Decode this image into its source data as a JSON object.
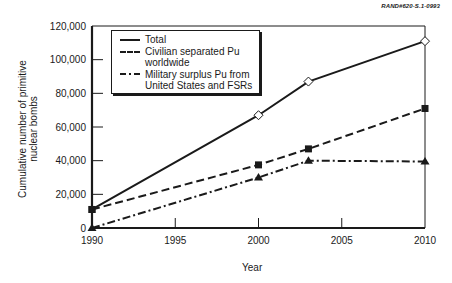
{
  "chart_data": {
    "type": "line",
    "title": "",
    "reference_id": "RAND#620-S.1-0993",
    "xlabel": "Year",
    "ylabel": "Cumulative number of primitive nuclear bombs",
    "xlim": [
      1990,
      2010
    ],
    "ylim": [
      0,
      120000
    ],
    "x_ticks": [
      "1990",
      "1995",
      "2000",
      "2005",
      "2010"
    ],
    "y_ticks": [
      "0",
      "20,000",
      "40,000",
      "60,000",
      "80,000",
      "100,000",
      "120,000"
    ],
    "grid": false,
    "legend_position": "upper left",
    "x": [
      1990,
      2000,
      2003,
      2010
    ],
    "series": [
      {
        "name": "Total",
        "style": "solid",
        "marker": "open-diamond",
        "values": [
          11000,
          67000,
          87000,
          111000
        ]
      },
      {
        "name": "Civilian separated Pu worldwide",
        "style": "dashed",
        "marker": "filled-square",
        "values": [
          11000,
          37500,
          47000,
          71000
        ]
      },
      {
        "name": "Military surplus Pu from United States and FSRs",
        "style": "dash-dot",
        "marker": "filled-triangle",
        "values": [
          0,
          30000,
          40000,
          39500
        ]
      }
    ]
  },
  "legend": {
    "items": [
      {
        "line1": "Total",
        "line2": ""
      },
      {
        "line1": "Civilian separated Pu",
        "line2": "worldwide"
      },
      {
        "line1": "Military surplus Pu from",
        "line2": "United States and FSRs"
      }
    ]
  },
  "axes": {
    "xlabel": "Year",
    "ylabel_line1": "Cumulative number of primitive",
    "ylabel_line2": "nuclear bombs"
  },
  "ref_label": "RAND#620-S.1-0993"
}
